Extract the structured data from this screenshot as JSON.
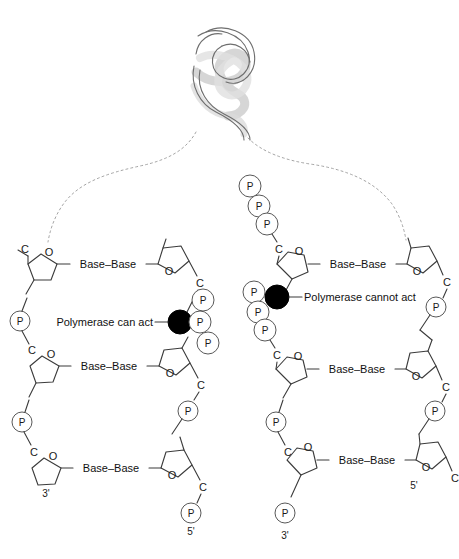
{
  "figure": {
    "background_color": "#ffffff",
    "line_color": "#3b3b3b",
    "dashed_color": "#9a9a9a",
    "black_dot_color": "#000000",
    "helix_color": "#6e6e6e"
  },
  "helix": {
    "name": "dna-double-helix",
    "description": "double helix ribbon at top center"
  },
  "labels": {
    "polymerase_can_act": "Polymerase can act",
    "polymerase_cannot_act": "Polymerase cannot act"
  },
  "base_pairs": {
    "text": "Base–Base",
    "left_count": 3,
    "right_count": 3
  },
  "atoms": {
    "carbon": "C",
    "oxygen": "O",
    "phosphate": "P"
  },
  "ends": {
    "left_three_prime": "3'",
    "left_five_prime": "5'",
    "right_three_prime": "3'",
    "right_five_prime": "5'"
  },
  "left_panel": {
    "name": "polymerase-can-act-panel",
    "carbons": [
      "C",
      "C",
      "C",
      "C",
      "C",
      "C"
    ],
    "oxygens": [
      "O",
      "O",
      "O",
      "O",
      "O",
      "O"
    ],
    "phosphate_circles": [
      "P",
      "P",
      "P",
      "P",
      "P",
      "P"
    ],
    "triphosphate_cluster": [
      "P",
      "P",
      "P"
    ],
    "base_pairs": [
      "Base–Base",
      "Base–Base",
      "Base–Base"
    ],
    "three_prime": "3'",
    "five_prime": "5'",
    "black_dot": "free-3-prime-hydroxyl"
  },
  "right_panel": {
    "name": "polymerase-cannot-act-panel",
    "carbons": [
      "C",
      "C",
      "C",
      "C",
      "C",
      "C"
    ],
    "oxygens": [
      "O",
      "O",
      "O",
      "O",
      "O",
      "O"
    ],
    "phosphate_circles": [
      "P",
      "P",
      "P",
      "P",
      "P",
      "P"
    ],
    "triphosphate_cluster_top": [
      "P",
      "P",
      "P"
    ],
    "triphosphate_cluster_mid": [
      "P",
      "P",
      "P"
    ],
    "base_pairs": [
      "Base–Base",
      "Base–Base",
      "Base–Base"
    ],
    "three_prime": "3'",
    "five_prime": "5'",
    "black_dot": "blocked-3-prime-position"
  },
  "caption": {
    "truncated_line": ""
  }
}
